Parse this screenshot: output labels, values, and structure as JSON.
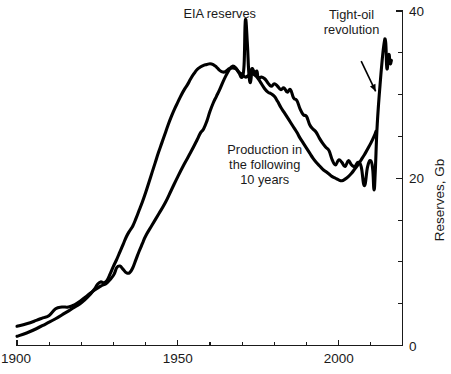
{
  "chart_data": {
    "type": "line",
    "title": "",
    "subtitle": "",
    "xlabel": "",
    "ylabel": "Reserves, Gb",
    "xlim": [
      1900,
      2020
    ],
    "ylim": [
      0,
      40
    ],
    "grid": false,
    "legend_position": "inline-annotations",
    "x_ticks_major": [
      1900,
      1950,
      2000
    ],
    "x_tick_labels": [
      "1900",
      "1950",
      "2000"
    ],
    "x_ticks_minor": [
      1910,
      1920,
      1930,
      1940,
      1960,
      1970,
      1980,
      1990,
      2010
    ],
    "y_ticks_major": [
      0,
      20,
      40
    ],
    "y_tick_labels": [
      "0",
      "20",
      "40"
    ],
    "y_ticks_minor": [
      5,
      10,
      15,
      25,
      30,
      35
    ],
    "series": [
      {
        "name": "EIA reserves",
        "color": "#000000",
        "points": [
          [
            1900,
            2.3
          ],
          [
            1903,
            2.6
          ],
          [
            1906,
            3.0
          ],
          [
            1908,
            3.3
          ],
          [
            1910,
            3.6
          ],
          [
            1912,
            4.4
          ],
          [
            1914,
            4.6
          ],
          [
            1916,
            4.6
          ],
          [
            1918,
            4.9
          ],
          [
            1920,
            5.4
          ],
          [
            1922,
            6.0
          ],
          [
            1924,
            6.6
          ],
          [
            1926,
            7.1
          ],
          [
            1928,
            7.5
          ],
          [
            1930,
            8.4
          ],
          [
            1931,
            9.3
          ],
          [
            1932,
            9.5
          ],
          [
            1933,
            9.1
          ],
          [
            1934,
            8.7
          ],
          [
            1935,
            8.7
          ],
          [
            1936,
            9.3
          ],
          [
            1937,
            10.3
          ],
          [
            1938,
            11.3
          ],
          [
            1939,
            12.2
          ],
          [
            1940,
            13.1
          ],
          [
            1942,
            14.4
          ],
          [
            1944,
            15.7
          ],
          [
            1946,
            17.0
          ],
          [
            1948,
            18.6
          ],
          [
            1950,
            20.2
          ],
          [
            1952,
            21.7
          ],
          [
            1954,
            23.1
          ],
          [
            1956,
            24.6
          ],
          [
            1957,
            25.4
          ],
          [
            1958,
            25.9
          ],
          [
            1959,
            26.8
          ],
          [
            1960,
            28.0
          ],
          [
            1961,
            29.0
          ],
          [
            1962,
            29.8
          ],
          [
            1963,
            30.6
          ],
          [
            1964,
            31.5
          ],
          [
            1965,
            32.3
          ],
          [
            1966,
            33.0
          ],
          [
            1967,
            33.4
          ],
          [
            1968,
            33.2
          ],
          [
            1969,
            32.6
          ],
          [
            1970,
            32.1
          ],
          [
            1970.6,
            33.6
          ],
          [
            1971,
            38.9
          ],
          [
            1971.6,
            36.2
          ],
          [
            1972,
            33.0
          ],
          [
            1972.4,
            31.5
          ],
          [
            1972.8,
            32.0
          ],
          [
            1973,
            33.1
          ],
          [
            1974,
            32.6
          ],
          [
            1974.6,
            32.8
          ],
          [
            1975,
            32.0
          ],
          [
            1976,
            32.1
          ],
          [
            1977,
            31.9
          ],
          [
            1978,
            31.4
          ],
          [
            1979,
            31.0
          ],
          [
            1980,
            31.3
          ],
          [
            1981,
            31.0
          ],
          [
            1982,
            30.6
          ],
          [
            1983,
            30.8
          ],
          [
            1984,
            30.3
          ],
          [
            1985,
            30.6
          ],
          [
            1986,
            29.6
          ],
          [
            1987,
            29.3
          ],
          [
            1988,
            28.3
          ],
          [
            1989,
            27.6
          ],
          [
            1990,
            27.4
          ],
          [
            1991,
            26.4
          ],
          [
            1992,
            25.9
          ],
          [
            1993,
            25.5
          ],
          [
            1994,
            24.8
          ],
          [
            1995,
            24.2
          ],
          [
            1996,
            23.7
          ],
          [
            1997,
            23.3
          ],
          [
            1998,
            22.2
          ],
          [
            1999,
            21.6
          ],
          [
            2000,
            22.2
          ],
          [
            2001,
            21.9
          ],
          [
            2002,
            21.4
          ],
          [
            2003,
            22.1
          ],
          [
            2004,
            21.6
          ],
          [
            2005,
            21.4
          ],
          [
            2006,
            21.9
          ],
          [
            2007,
            21.4
          ],
          [
            2008,
            19.1
          ],
          [
            2009,
            21.4
          ],
          [
            2010,
            22.1
          ],
          [
            2010.6,
            21.0
          ],
          [
            2011,
            18.6
          ],
          [
            2011.4,
            21.0
          ],
          [
            2012,
            26.5
          ],
          [
            2013,
            31.8
          ],
          [
            2014,
            35.8
          ],
          [
            2014.6,
            36.3
          ],
          [
            2015,
            33.1
          ],
          [
            2015.6,
            34.8
          ],
          [
            2016,
            33.7
          ],
          [
            2016.4,
            34.1
          ]
        ]
      },
      {
        "name": "Production in the following 10 years",
        "color": "#000000",
        "points": [
          [
            1900,
            1.1
          ],
          [
            1903,
            1.5
          ],
          [
            1906,
            2.0
          ],
          [
            1909,
            2.6
          ],
          [
            1912,
            3.2
          ],
          [
            1915,
            3.9
          ],
          [
            1918,
            4.6
          ],
          [
            1920,
            5.1
          ],
          [
            1922,
            5.8
          ],
          [
            1924,
            6.7
          ],
          [
            1925,
            7.3
          ],
          [
            1926,
            7.6
          ],
          [
            1927,
            7.5
          ],
          [
            1928,
            7.8
          ],
          [
            1929,
            8.6
          ],
          [
            1930,
            9.5
          ],
          [
            1931,
            10.3
          ],
          [
            1932,
            11.2
          ],
          [
            1933,
            12.1
          ],
          [
            1934,
            13.0
          ],
          [
            1935,
            13.7
          ],
          [
            1936,
            14.3
          ],
          [
            1937,
            15.2
          ],
          [
            1938,
            16.2
          ],
          [
            1939,
            17.2
          ],
          [
            1940,
            18.3
          ],
          [
            1941,
            19.5
          ],
          [
            1942,
            20.7
          ],
          [
            1943,
            21.9
          ],
          [
            1944,
            23.1
          ],
          [
            1945,
            24.2
          ],
          [
            1946,
            25.3
          ],
          [
            1947,
            26.4
          ],
          [
            1948,
            27.4
          ],
          [
            1949,
            28.3
          ],
          [
            1950,
            29.1
          ],
          [
            1951,
            29.9
          ],
          [
            1952,
            30.6
          ],
          [
            1953,
            31.2
          ],
          [
            1954,
            31.9
          ],
          [
            1955,
            32.5
          ],
          [
            1956,
            33.0
          ],
          [
            1957,
            33.3
          ],
          [
            1958,
            33.5
          ],
          [
            1959,
            33.6
          ],
          [
            1960,
            33.7
          ],
          [
            1961,
            33.6
          ],
          [
            1962,
            33.3
          ],
          [
            1963,
            32.9
          ],
          [
            1964,
            32.7
          ],
          [
            1965,
            32.8
          ],
          [
            1966,
            33.1
          ],
          [
            1967,
            33.2
          ],
          [
            1968,
            33.1
          ],
          [
            1969,
            32.7
          ],
          [
            1970,
            32.4
          ],
          [
            1971,
            32.1
          ],
          [
            1972,
            32.3
          ],
          [
            1973,
            32.5
          ],
          [
            1974,
            32.3
          ],
          [
            1975,
            31.9
          ],
          [
            1976,
            31.3
          ],
          [
            1977,
            30.7
          ],
          [
            1978,
            30.3
          ],
          [
            1979,
            30.1
          ],
          [
            1980,
            29.8
          ],
          [
            1981,
            29.2
          ],
          [
            1982,
            28.5
          ],
          [
            1983,
            27.9
          ],
          [
            1984,
            27.3
          ],
          [
            1985,
            26.7
          ],
          [
            1986,
            26.1
          ],
          [
            1987,
            25.5
          ],
          [
            1988,
            24.8
          ],
          [
            1989,
            24.2
          ],
          [
            1990,
            23.6
          ],
          [
            1991,
            23.0
          ],
          [
            1992,
            22.4
          ],
          [
            1993,
            21.9
          ],
          [
            1994,
            21.5
          ],
          [
            1995,
            21.1
          ],
          [
            1996,
            20.8
          ],
          [
            1997,
            20.5
          ],
          [
            1998,
            20.2
          ],
          [
            1999,
            20.0
          ],
          [
            2000,
            19.8
          ],
          [
            2001,
            19.7
          ],
          [
            2002,
            19.9
          ],
          [
            2003,
            20.2
          ],
          [
            2004,
            20.6
          ],
          [
            2005,
            21.1
          ],
          [
            2006,
            21.6
          ],
          [
            2007,
            22.2
          ],
          [
            2008,
            22.8
          ],
          [
            2009,
            23.5
          ],
          [
            2010,
            24.2
          ],
          [
            2011,
            25.0
          ],
          [
            2011.6,
            25.6
          ]
        ]
      }
    ],
    "annotations": [
      {
        "name": "eia-reserves-label",
        "lines": [
          "EIA reserves"
        ],
        "x": 1963,
        "y": 39.2,
        "anchor": "middle",
        "arrow": false
      },
      {
        "name": "tight-oil-revolution-label",
        "lines": [
          "Tight-oil",
          "revolution"
        ],
        "x": 2004,
        "y": 39.0,
        "anchor": "middle",
        "arrow": true,
        "arrow_from_x": 2007,
        "arrow_from_y": 34.0,
        "arrow_to_x": 2011.5,
        "arrow_to_y": 30.4
      },
      {
        "name": "production-following-10-years-label",
        "lines": [
          "Production in",
          "the following",
          "10 years"
        ],
        "x": 1977,
        "y": 22.9,
        "anchor": "middle",
        "arrow": false
      }
    ]
  },
  "axes": {
    "y_axis_title": "Reserves, Gb",
    "y_axis_side": "right",
    "x_axis_side": "bottom"
  }
}
